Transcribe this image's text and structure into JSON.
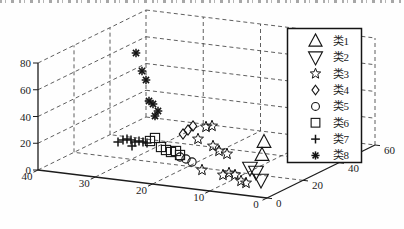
{
  "figure": {
    "background": "#fefefe",
    "axis_color": "#1c1c1c",
    "grid_color": "#4d4d4d",
    "marker_color": "#141414",
    "legend_background": "#ffffff",
    "legend_border": "#141414"
  },
  "chart_data": {
    "type": "scatter",
    "projection": "3d-box",
    "grid": "dashed",
    "title": "",
    "xlabel": "",
    "ylabel": "",
    "zlabel": "",
    "axes": {
      "x": {
        "range": [
          0,
          40
        ],
        "ticks": [
          40,
          30,
          20,
          10,
          0
        ],
        "grid_values": [
          10,
          20,
          30
        ]
      },
      "y": {
        "range": [
          0,
          60
        ],
        "ticks": [
          0,
          20,
          40,
          60
        ],
        "grid_values": [
          20,
          40
        ]
      },
      "z": {
        "range": [
          0,
          80
        ],
        "ticks": [
          0,
          20,
          40,
          60,
          80
        ],
        "grid_values": [
          20,
          40,
          60,
          80
        ]
      }
    },
    "layout_px": {
      "corner_front": [
        267,
        198
      ],
      "corner_left": [
        38,
        170
      ],
      "corner_right": [
        375,
        145
      ],
      "z_height": 107,
      "legend_box": {
        "x": 287.5,
        "y": 28.5,
        "w": 74,
        "h": 134
      }
    },
    "legend": {
      "position": "right",
      "entries": [
        {
          "label": "类1",
          "marker": "triangle-up"
        },
        {
          "label": "类2",
          "marker": "triangle-down"
        },
        {
          "label": "类3",
          "marker": "star"
        },
        {
          "label": "类4",
          "marker": "diamond"
        },
        {
          "label": "类5",
          "marker": "circle"
        },
        {
          "label": "类6",
          "marker": "square"
        },
        {
          "label": "类7",
          "marker": "plus"
        },
        {
          "label": "类8",
          "marker": "asterisk"
        }
      ]
    },
    "series": [
      {
        "name": "类1",
        "marker": "triangle-up",
        "points_px": [
          [
            264,
            142
          ],
          [
            262,
            155
          ]
        ]
      },
      {
        "name": "类2",
        "marker": "triangle-down",
        "points_px": [
          [
            250,
            168
          ],
          [
            256,
            172
          ],
          [
            261,
            180
          ]
        ]
      },
      {
        "name": "类3",
        "marker": "star",
        "points_px": [
          [
            206,
            127
          ],
          [
            212,
            126
          ],
          [
            198,
            139
          ],
          [
            213,
            146
          ],
          [
            219,
            151
          ],
          [
            227,
            154
          ],
          [
            202,
            170
          ],
          [
            223,
            175
          ],
          [
            229,
            173
          ],
          [
            235,
            175
          ],
          [
            241,
            181
          ],
          [
            246,
            183
          ]
        ]
      },
      {
        "name": "类4",
        "marker": "diamond",
        "points_px": [
          [
            193,
            126
          ],
          [
            188,
            130
          ],
          [
            183,
            134
          ]
        ]
      },
      {
        "name": "类5",
        "marker": "circle",
        "points_px": [
          [
            180,
            157
          ],
          [
            186,
            159
          ],
          [
            192,
            162
          ]
        ]
      },
      {
        "name": "类6",
        "marker": "square",
        "points_px": [
          [
            150,
            141
          ],
          [
            155,
            138
          ],
          [
            161,
            147
          ],
          [
            166,
            150
          ],
          [
            171,
            152
          ],
          [
            176,
            151
          ],
          [
            180,
            155
          ]
        ]
      },
      {
        "name": "类7",
        "marker": "plus",
        "points_px": [
          [
            118,
            142
          ],
          [
            123,
            140
          ],
          [
            127,
            139
          ],
          [
            131,
            140
          ],
          [
            135,
            142
          ],
          [
            139,
            141
          ],
          [
            143,
            142
          ],
          [
            147,
            143
          ],
          [
            132,
            146
          ]
        ]
      },
      {
        "name": "类8",
        "marker": "asterisk",
        "points_px": [
          [
            136,
            53
          ],
          [
            142,
            71
          ],
          [
            146,
            80
          ],
          [
            149,
            101
          ],
          [
            153,
            104
          ],
          [
            158,
            111
          ],
          [
            155,
            116
          ]
        ]
      }
    ]
  }
}
